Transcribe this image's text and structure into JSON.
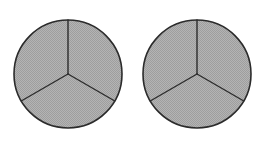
{
  "figure": {
    "background_color": "#ffffff",
    "width": 266,
    "height": 148,
    "shape_count": 2,
    "sectors_per_shape": 3,
    "sector_angle_degrees": 120,
    "fill_color": "#acacac",
    "fill_pattern": "dithered-halftone-gray",
    "outline_color": "#2b2b2b",
    "outline_width": 1.6,
    "divider_color": "#2b2b2b",
    "divider_width": 1.4,
    "shapes": [
      {
        "id": "circle-left",
        "label": "Left circle",
        "center_x": 68,
        "center_y": 74,
        "radius": 54,
        "sectors": [
          {
            "id": "left-sector-top-right",
            "label": "Upper right third",
            "start_angle": 90,
            "end_angle": 330,
            "sweep_degrees": 120
          },
          {
            "id": "left-sector-bottom",
            "label": "Bottom third",
            "start_angle": 330,
            "end_angle": 210,
            "sweep_degrees": 120
          },
          {
            "id": "left-sector-top-left",
            "label": "Upper left third",
            "start_angle": 210,
            "end_angle": 90,
            "sweep_degrees": 120
          }
        ],
        "dividers": [
          {
            "id": "left-divider-up",
            "label": "Vertical radius up",
            "angle": 90
          },
          {
            "id": "left-divider-lower-left",
            "label": "Radius down-left",
            "angle": 210
          },
          {
            "id": "left-divider-lower-right",
            "label": "Radius down-right",
            "angle": 330
          }
        ]
      },
      {
        "id": "circle-right",
        "label": "Right circle",
        "center_x": 197,
        "center_y": 74,
        "radius": 54,
        "sectors": [
          {
            "id": "right-sector-top-right",
            "label": "Upper right third",
            "start_angle": 90,
            "end_angle": 330,
            "sweep_degrees": 120
          },
          {
            "id": "right-sector-bottom",
            "label": "Bottom third",
            "start_angle": 330,
            "end_angle": 210,
            "sweep_degrees": 120
          },
          {
            "id": "right-sector-top-left",
            "label": "Upper left third",
            "start_angle": 210,
            "end_angle": 90,
            "sweep_degrees": 120
          }
        ],
        "dividers": [
          {
            "id": "right-divider-up",
            "label": "Vertical radius up",
            "angle": 90
          },
          {
            "id": "right-divider-lower-left",
            "label": "Radius down-left",
            "angle": 210
          },
          {
            "id": "right-divider-lower-right",
            "label": "Radius down-right",
            "angle": 330
          }
        ]
      }
    ]
  }
}
